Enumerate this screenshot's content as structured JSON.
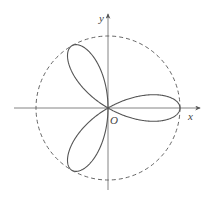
{
  "diagram": {
    "type": "polar-rose-curve",
    "colors": {
      "curve": "#555555",
      "axes": "#666666",
      "circle": "#555555",
      "background": "#ffffff"
    },
    "labels": {
      "x_axis": "x",
      "y_axis": "y",
      "origin": "O"
    },
    "petals": 3,
    "petal_directions_deg": [
      0,
      120,
      240
    ],
    "circle_style": "dashed"
  }
}
